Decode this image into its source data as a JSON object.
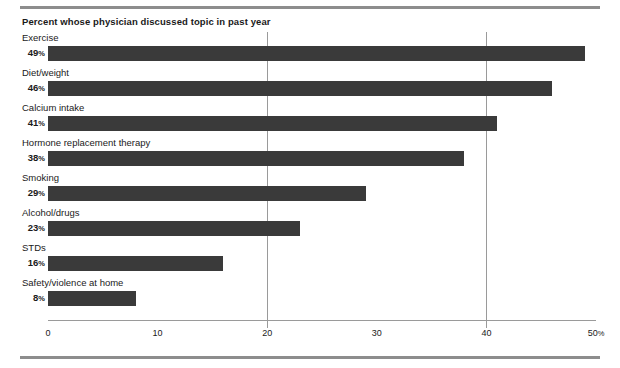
{
  "chart_data": {
    "type": "bar",
    "orientation": "horizontal",
    "title": "Percent whose physician discussed topic in past year",
    "xlabel": "",
    "ylabel": "",
    "xlim": [
      0,
      50
    ],
    "grid": true,
    "gridlines_at": [
      20,
      40
    ],
    "legend": null,
    "bar_color": "#3a3a3a",
    "categories": [
      "Exercise",
      "Diet/weight",
      "Calcium intake",
      "Hormone replacement therapy",
      "Smoking",
      "Alcohol/drugs",
      "STDs",
      "Safety/violence at home"
    ],
    "values": [
      49,
      46,
      41,
      38,
      29,
      23,
      16,
      8
    ],
    "value_labels": [
      "49%",
      "46%",
      "41%",
      "38%",
      "29%",
      "23%",
      "16%",
      "8%"
    ],
    "xticks": [
      0,
      10,
      20,
      30,
      40,
      50
    ],
    "xtick_labels": [
      "0",
      "10",
      "20",
      "30",
      "40",
      "50%"
    ]
  },
  "bars": [
    {
      "category": "Exercise",
      "value": 49,
      "value_number": "49",
      "value_suffix": "%"
    },
    {
      "category": "Diet/weight",
      "value": 46,
      "value_number": "46",
      "value_suffix": "%"
    },
    {
      "category": "Calcium intake",
      "value": 41,
      "value_number": "41",
      "value_suffix": "%"
    },
    {
      "category": "Hormone replacement therapy",
      "value": 38,
      "value_number": "38",
      "value_suffix": "%"
    },
    {
      "category": "Smoking",
      "value": 29,
      "value_number": "29",
      "value_suffix": "%"
    },
    {
      "category": "Alcohol/drugs",
      "value": 23,
      "value_number": "23",
      "value_suffix": "%"
    },
    {
      "category": "STDs",
      "value": 16,
      "value_number": "16",
      "value_suffix": "%"
    },
    {
      "category": "Safety/violence at home",
      "value": 8,
      "value_number": "8",
      "value_suffix": "%"
    }
  ],
  "axis": {
    "ticks": [
      {
        "value": 0,
        "number": "0",
        "suffix": ""
      },
      {
        "value": 10,
        "number": "10",
        "suffix": ""
      },
      {
        "value": 20,
        "number": "20",
        "suffix": ""
      },
      {
        "value": 30,
        "number": "30",
        "suffix": ""
      },
      {
        "value": 40,
        "number": "40",
        "suffix": ""
      },
      {
        "value": 50,
        "number": "50",
        "suffix": "%"
      }
    ]
  },
  "colors": {
    "bar": "#3a3a3a",
    "rule": "#8d8d8d",
    "gridline": "#9a9a9a",
    "text": "#1a1a1a"
  }
}
